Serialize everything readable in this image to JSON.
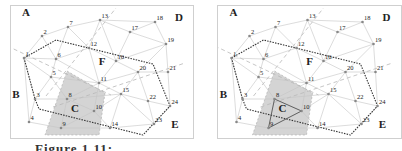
{
  "figure": {
    "caption": "Figure 1.11: ...",
    "panels": [
      "left",
      "right"
    ]
  },
  "colors": {
    "edge": "#c4c4c4",
    "boundary": "#333333",
    "divider": "#b8b8b8",
    "shade": "#d4d4d4",
    "node": "#888888",
    "highlight_triangle": "#555555"
  },
  "regions": [
    {
      "id": "A",
      "x": 25,
      "y": 15
    },
    {
      "id": "B",
      "x": 15,
      "y": 97
    },
    {
      "id": "C",
      "x": 74,
      "y": 111
    },
    {
      "id": "D",
      "x": 178,
      "y": 20
    },
    {
      "id": "E",
      "x": 174,
      "y": 127
    },
    {
      "id": "F",
      "x": 101,
      "y": 64
    }
  ],
  "nodes": [
    {
      "id": "1",
      "x": 23,
      "y": 57
    },
    {
      "id": "2",
      "x": 41,
      "y": 35
    },
    {
      "id": "3",
      "x": 34,
      "y": 98
    },
    {
      "id": "4",
      "x": 28,
      "y": 121
    },
    {
      "id": "5",
      "x": 50,
      "y": 76
    },
    {
      "id": "6",
      "x": 55,
      "y": 58
    },
    {
      "id": "7",
      "x": 67,
      "y": 26
    },
    {
      "id": "8",
      "x": 66,
      "y": 98
    },
    {
      "id": "9",
      "x": 60,
      "y": 127
    },
    {
      "id": "10",
      "x": 93,
      "y": 110
    },
    {
      "id": "11",
      "x": 98,
      "y": 82
    },
    {
      "id": "12",
      "x": 88,
      "y": 47
    },
    {
      "id": "13",
      "x": 99,
      "y": 19
    },
    {
      "id": "14",
      "x": 109,
      "y": 127
    },
    {
      "id": "15",
      "x": 120,
      "y": 93
    },
    {
      "id": "16",
      "x": 115,
      "y": 60
    },
    {
      "id": "17",
      "x": 129,
      "y": 31
    },
    {
      "id": "18",
      "x": 154,
      "y": 21
    },
    {
      "id": "19",
      "x": 165,
      "y": 43
    },
    {
      "id": "20",
      "x": 137,
      "y": 71
    },
    {
      "id": "21",
      "x": 167,
      "y": 71
    },
    {
      "id": "22",
      "x": 147,
      "y": 100
    },
    {
      "id": "23",
      "x": 153,
      "y": 123
    },
    {
      "id": "24",
      "x": 169,
      "y": 105
    }
  ],
  "edges": [
    [
      "1",
      "2"
    ],
    [
      "2",
      "7"
    ],
    [
      "7",
      "13"
    ],
    [
      "13",
      "18"
    ],
    [
      "18",
      "19"
    ],
    [
      "19",
      "21"
    ],
    [
      "21",
      "24"
    ],
    [
      "1",
      "6"
    ],
    [
      "1",
      "5"
    ],
    [
      "1",
      "3"
    ],
    [
      "1",
      "4"
    ],
    [
      "2",
      "6"
    ],
    [
      "6",
      "7"
    ],
    [
      "6",
      "5"
    ],
    [
      "6",
      "12"
    ],
    [
      "7",
      "12"
    ],
    [
      "12",
      "13"
    ],
    [
      "13",
      "16"
    ],
    [
      "13",
      "17"
    ],
    [
      "17",
      "18"
    ],
    [
      "17",
      "16"
    ],
    [
      "17",
      "19"
    ],
    [
      "12",
      "16"
    ],
    [
      "12",
      "11"
    ],
    [
      "5",
      "3"
    ],
    [
      "5",
      "8"
    ],
    [
      "5",
      "11"
    ],
    [
      "6",
      "11"
    ],
    [
      "3",
      "4"
    ],
    [
      "3",
      "8"
    ],
    [
      "4",
      "9"
    ],
    [
      "8",
      "9"
    ],
    [
      "8",
      "10"
    ],
    [
      "8",
      "11"
    ],
    [
      "9",
      "10"
    ],
    [
      "9",
      "14"
    ],
    [
      "10",
      "14"
    ],
    [
      "10",
      "11"
    ],
    [
      "10",
      "15"
    ],
    [
      "11",
      "15"
    ],
    [
      "11",
      "16"
    ],
    [
      "11",
      "20"
    ],
    [
      "16",
      "20"
    ],
    [
      "16",
      "19"
    ],
    [
      "20",
      "19"
    ],
    [
      "20",
      "21"
    ],
    [
      "20",
      "15"
    ],
    [
      "20",
      "22"
    ],
    [
      "15",
      "22"
    ],
    [
      "15",
      "14"
    ],
    [
      "15",
      "23"
    ],
    [
      "22",
      "23"
    ],
    [
      "22",
      "24"
    ],
    [
      "23",
      "24"
    ],
    [
      "14",
      "23"
    ],
    [
      "8",
      "15"
    ]
  ],
  "boundary_path": [
    [
      23,
      57
    ],
    [
      55,
      39
    ],
    [
      152,
      63
    ],
    [
      169,
      105
    ],
    [
      142,
      134
    ],
    [
      38,
      108
    ],
    [
      34,
      98
    ],
    [
      23,
      57
    ]
  ],
  "divider_lines": [
    [
      [
        0,
        42
      ],
      [
        110,
        94
      ]
    ],
    [
      [
        52,
        106
      ],
      [
        184,
        62
      ]
    ],
    [
      [
        45,
        95
      ],
      [
        115,
        7
      ]
    ]
  ],
  "shaded_region": [
    [
      66,
      70
    ],
    [
      104,
      92
    ],
    [
      98,
      134
    ],
    [
      44,
      134
    ]
  ],
  "right_panel": {
    "highlight_triangle": [
      "8",
      "9",
      "10"
    ]
  }
}
